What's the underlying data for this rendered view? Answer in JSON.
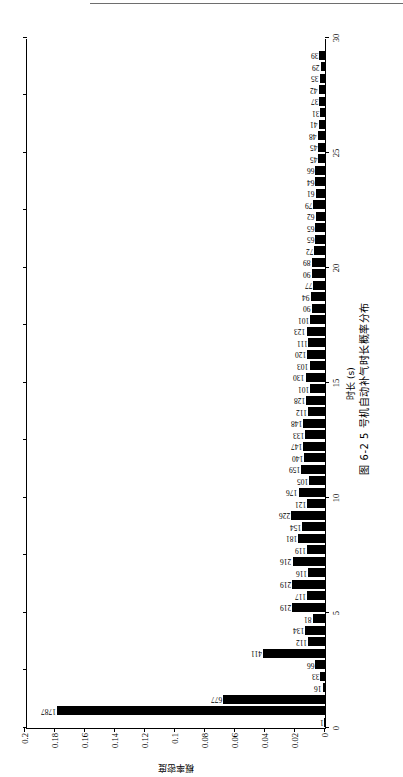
{
  "page": {
    "has_top_rule": true
  },
  "figure": {
    "caption": "图 6-2  5 号机自动补气时长概率分布",
    "rotation_degrees": -90,
    "axis_color": "#000000",
    "bar_color": "#000000",
    "background": "#ffffff"
  },
  "chart_data": {
    "type": "bar",
    "title": "图 6-2  5 号机自动补气时长概率分布",
    "xlabel": "时长 (s)",
    "ylabel": "概率密度",
    "xlim": [
      0,
      30
    ],
    "ylim": [
      0,
      0.2
    ],
    "xticks": [
      0,
      5,
      10,
      15,
      20,
      25,
      30
    ],
    "yticks": [
      0,
      0.02,
      0.04,
      0.06,
      0.08,
      0.1,
      0.12,
      0.14,
      0.16,
      0.18,
      0.2
    ],
    "ytick_labels": [
      "0",
      "0.02",
      "0.04",
      "0.06",
      "0.08",
      "0.1",
      "0.12",
      "0.14",
      "0.16",
      "0.18",
      "0.2"
    ],
    "xtick_labels": [
      "0",
      "5",
      "10",
      "15",
      "20",
      "25",
      "30"
    ],
    "grid": false,
    "legend": null,
    "count_label_note": "Each bar is annotated with its raw sample count.",
    "total_count": 10000,
    "x": [
      0.25,
      0.75,
      1.25,
      1.75,
      2.25,
      2.75,
      3.25,
      3.75,
      4.25,
      4.75,
      5.25,
      5.75,
      6.25,
      6.75,
      7.25,
      7.75,
      8.25,
      8.75,
      9.25,
      9.75,
      10.25,
      10.75,
      11.25,
      11.75,
      12.25,
      12.75,
      13.25,
      13.75,
      14.25,
      14.75,
      15.25,
      15.75,
      16.25,
      16.75,
      17.25,
      17.75,
      18.25,
      18.75,
      19.25,
      19.75,
      20.25,
      20.75,
      21.25,
      21.75,
      22.25,
      22.75,
      23.25,
      23.75,
      24.25,
      24.75,
      25.25,
      25.75,
      26.25,
      26.75,
      27.25,
      27.75,
      28.25,
      28.75,
      29.25
    ],
    "counts": [
      1,
      1787,
      677,
      16,
      33,
      66,
      411,
      112,
      134,
      81,
      219,
      117,
      219,
      116,
      216,
      119,
      181,
      154,
      226,
      121,
      176,
      105,
      159,
      140,
      147,
      133,
      148,
      112,
      128,
      101,
      130,
      103,
      120,
      111,
      123,
      101,
      90,
      94,
      77,
      90,
      89,
      72,
      65,
      65,
      62,
      79,
      61,
      64,
      66,
      45,
      45,
      48,
      41,
      31,
      37,
      42,
      35,
      29,
      39
    ],
    "values": [
      0.0001,
      0.1787,
      0.0677,
      0.0016,
      0.0033,
      0.0066,
      0.0411,
      0.0112,
      0.0134,
      0.0081,
      0.0219,
      0.0117,
      0.0219,
      0.0116,
      0.0216,
      0.0119,
      0.0181,
      0.0154,
      0.0226,
      0.0121,
      0.0176,
      0.0105,
      0.0159,
      0.014,
      0.0147,
      0.0133,
      0.0148,
      0.0112,
      0.0128,
      0.0101,
      0.013,
      0.0103,
      0.012,
      0.0111,
      0.0123,
      0.0101,
      0.009,
      0.0094,
      0.0077,
      0.009,
      0.0089,
      0.0072,
      0.0065,
      0.0065,
      0.0062,
      0.0079,
      0.0061,
      0.0064,
      0.0066,
      0.0045,
      0.0045,
      0.0048,
      0.0041,
      0.0031,
      0.0037,
      0.0042,
      0.0035,
      0.0029,
      0.0039
    ],
    "bar_labels": [
      "1",
      "1787",
      "677",
      "16",
      "33",
      "66",
      "411",
      "112",
      "134",
      "81",
      "219",
      "117",
      "219",
      "116",
      "216",
      "119",
      "181",
      "154",
      "226",
      "121",
      "176",
      "105",
      "159",
      "140",
      "147",
      "133",
      "148",
      "112",
      "128",
      "101",
      "130",
      "103",
      "120",
      "111",
      "123",
      "101",
      "90",
      "94",
      "77",
      "90",
      "89",
      "72",
      "65",
      "65",
      "62",
      "79",
      "61",
      "64",
      "66",
      "45",
      "45",
      "48",
      "41",
      "31",
      "37",
      "42",
      "35",
      "29",
      "39"
    ]
  }
}
